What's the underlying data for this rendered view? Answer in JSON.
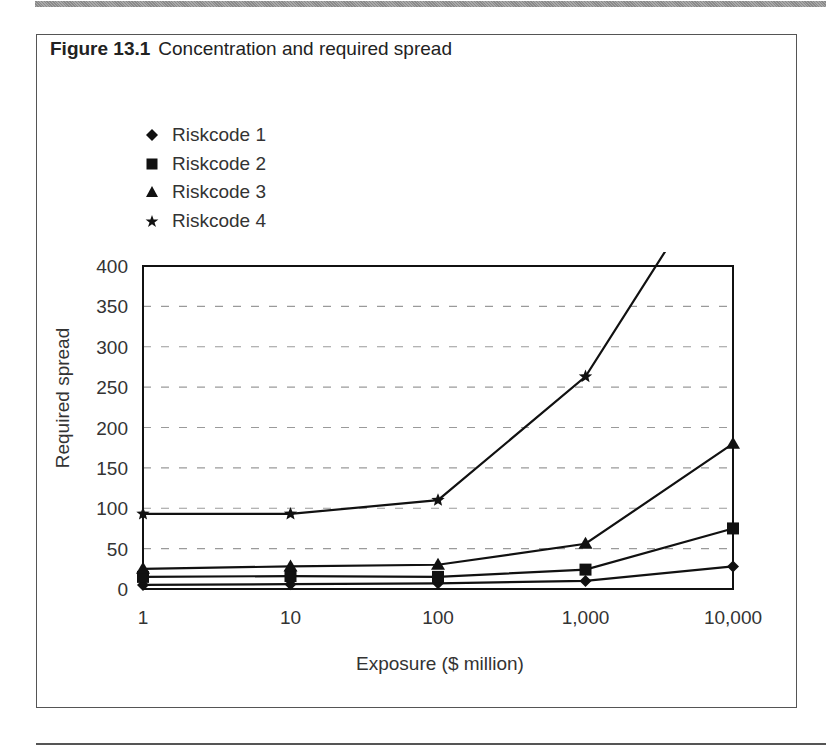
{
  "figure": {
    "number": "Figure 13.1",
    "caption": "Concentration and required spread"
  },
  "legend": [
    {
      "label": "Riskcode 1",
      "marker": "diamond"
    },
    {
      "label": "Riskcode 2",
      "marker": "square"
    },
    {
      "label": "Riskcode 3",
      "marker": "triangle"
    },
    {
      "label": "Riskcode 4",
      "marker": "star"
    }
  ],
  "colors": {
    "line": "#111111",
    "grid": "#9a9a9a",
    "axis": "#111111",
    "text": "#333333"
  },
  "chart_data": {
    "type": "line",
    "title": "Concentration and required spread",
    "xlabel": "Exposure ($ million)",
    "ylabel": "Required spread",
    "x_scale": "log",
    "categories": [
      "1",
      "10",
      "100",
      "1,000",
      "10,000"
    ],
    "x": [
      1,
      10,
      100,
      1000,
      10000
    ],
    "ylim": [
      0,
      400
    ],
    "yticks": [
      0,
      50,
      100,
      150,
      200,
      250,
      300,
      350,
      400
    ],
    "grid": {
      "horizontal": true,
      "style": "dashed"
    },
    "legend_position": "top-left, above plot",
    "series": [
      {
        "name": "Riskcode 1",
        "marker": "diamond",
        "values": [
          5,
          6,
          7,
          10,
          28
        ]
      },
      {
        "name": "Riskcode 2",
        "marker": "square",
        "values": [
          15,
          16,
          15,
          24,
          75
        ]
      },
      {
        "name": "Riskcode 3",
        "marker": "triangle",
        "values": [
          25,
          28,
          30,
          56,
          180
        ]
      },
      {
        "name": "Riskcode 4",
        "marker": "star",
        "values": [
          93,
          93,
          110,
          263,
          550
        ]
      }
    ],
    "annotations": [
      "Riskcode 4 line exceeds the 400 y-axis limit beyond 1,000 (clipped)"
    ]
  }
}
